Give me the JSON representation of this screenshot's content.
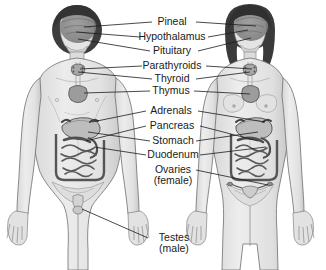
{
  "diagram": {
    "figures": [
      {
        "name": "male-figure",
        "side": "left",
        "sex": "male"
      },
      {
        "name": "female-figure",
        "side": "right",
        "sex": "female"
      }
    ],
    "colors": {
      "background": "#ffffff",
      "body_fill": "#e8e8e8",
      "body_shade": "#cfcfcf",
      "body_outline": "#6e6e6e",
      "hair": "#3a3a3a",
      "brain": "#8a8a8a",
      "organ_fill": "#b9b9b9",
      "organ_outline": "#555555",
      "leader_line": "#1c1c1c",
      "label_text": "#1a1a1a"
    },
    "labels": [
      {
        "id": "pineal",
        "text": "Pineal",
        "sub": ""
      },
      {
        "id": "hypothalamus",
        "text": "Hypothalamus",
        "sub": ""
      },
      {
        "id": "pituitary",
        "text": "Pituitary",
        "sub": ""
      },
      {
        "id": "parathyroids",
        "text": "Parathyroids",
        "sub": ""
      },
      {
        "id": "thyroid",
        "text": "Thyroid",
        "sub": ""
      },
      {
        "id": "thymus",
        "text": "Thymus",
        "sub": ""
      },
      {
        "id": "adrenals",
        "text": "Adrenals",
        "sub": ""
      },
      {
        "id": "pancreas",
        "text": "Pancreas",
        "sub": ""
      },
      {
        "id": "stomach",
        "text": "Stomach",
        "sub": ""
      },
      {
        "id": "duodenum",
        "text": "Duodenum",
        "sub": ""
      },
      {
        "id": "ovaries",
        "text": "Ovaries",
        "sub": "(female)"
      },
      {
        "id": "testes",
        "text": "Testes",
        "sub": "(male)"
      }
    ]
  }
}
